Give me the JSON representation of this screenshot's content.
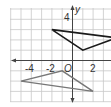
{
  "graph": {
    "x_axis_label": "x",
    "y_axis_label": "y",
    "origin_label": "O",
    "x_tick_labels": [
      {
        "value": -4,
        "text": "-4"
      },
      {
        "value": -2,
        "text": "-2"
      },
      {
        "value": 2,
        "text": "2"
      }
    ],
    "y_tick_labels": [
      {
        "value": 4,
        "text": "4"
      }
    ],
    "grid_color": "#c8c8c8",
    "axis_color": "#444444"
  },
  "shapes": {
    "top_triangle": {
      "color": "#1a1a1a",
      "vertices": [
        [
          -2,
          3
        ],
        [
          1,
          1
        ],
        [
          4.3,
          2.2
        ]
      ]
    },
    "bottom_triangle": {
      "color": "#777777",
      "vertices": [
        [
          -5,
          -2
        ],
        [
          -1,
          -1
        ],
        [
          2,
          -3
        ]
      ]
    }
  }
}
